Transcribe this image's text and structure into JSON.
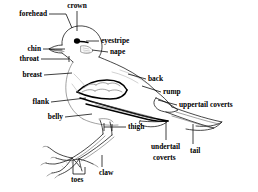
{
  "figure": {
    "background_color": "#ffffff",
    "ink_color": "#000000",
    "width": 258,
    "height": 192
  },
  "labels": [
    {
      "id": "forehead",
      "text": "forehead",
      "x": 47,
      "y": 14,
      "align": "end",
      "target_x": 76,
      "target_y": 30
    },
    {
      "id": "crown",
      "text": "crown",
      "x": 77,
      "y": 7,
      "align": "mid",
      "target_x": 77,
      "target_y": 30
    },
    {
      "id": "eyestripe",
      "text": "eyestripe",
      "x": 101,
      "y": 41,
      "align": "start",
      "target_x": 85,
      "target_y": 41
    },
    {
      "id": "nape",
      "text": "nape",
      "x": 110,
      "y": 52,
      "align": "start",
      "target_x": 90,
      "target_y": 52
    },
    {
      "id": "chin",
      "text": "chin",
      "x": 41,
      "y": 49,
      "align": "end",
      "target_x": 72,
      "target_y": 49
    },
    {
      "id": "throat",
      "text": "throat",
      "x": 39,
      "y": 59,
      "align": "end",
      "target_x": 70,
      "target_y": 57
    },
    {
      "id": "breast",
      "text": "breast",
      "x": 42,
      "y": 75,
      "align": "end",
      "target_x": 72,
      "target_y": 75
    },
    {
      "id": "back",
      "text": "back",
      "x": 148,
      "y": 79,
      "align": "start",
      "target_x": 129,
      "target_y": 75
    },
    {
      "id": "rump",
      "text": "rump",
      "x": 163,
      "y": 92,
      "align": "start",
      "target_x": 143,
      "target_y": 87
    },
    {
      "id": "uppertail-coverts",
      "text": "uppertail coverts",
      "x": 179,
      "y": 105,
      "align": "start",
      "target_x": 160,
      "target_y": 102
    },
    {
      "id": "flank",
      "text": "flank",
      "x": 49,
      "y": 102,
      "align": "end",
      "target_x": 88,
      "target_y": 99
    },
    {
      "id": "belly",
      "text": "belly",
      "x": 63,
      "y": 117,
      "align": "end",
      "target_x": 92,
      "target_y": 115
    },
    {
      "id": "thigh",
      "text": "thigh",
      "x": 128,
      "y": 127,
      "align": "start",
      "target_x": 112,
      "target_y": 127
    },
    {
      "id": "undertail-coverts",
      "text": "undertail",
      "x": 151,
      "y": 147,
      "align": "start",
      "target_x": 170,
      "target_y": 120
    },
    {
      "id": "undertail-coverts-2",
      "text": "coverts",
      "x": 153,
      "y": 158,
      "align": "start",
      "target_x": 0,
      "target_y": 0
    },
    {
      "id": "tail",
      "text": "tail",
      "x": 190,
      "y": 151,
      "align": "start",
      "target_x": 193,
      "target_y": 125
    },
    {
      "id": "toes",
      "text": "toes",
      "x": 71,
      "y": 180,
      "align": "start",
      "target_x": 74,
      "target_y": 160
    },
    {
      "id": "claw",
      "text": "claw",
      "x": 99,
      "y": 173,
      "align": "start",
      "target_x": 104,
      "target_y": 155
    }
  ],
  "parts": [
    "forehead",
    "crown",
    "eyestripe",
    "nape",
    "chin",
    "throat",
    "breast",
    "back",
    "rump",
    "uppertail coverts",
    "flank",
    "belly",
    "thigh",
    "undertail coverts",
    "tail",
    "toes",
    "claw"
  ]
}
